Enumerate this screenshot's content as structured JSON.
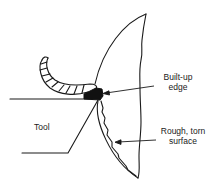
{
  "diagram": {
    "type": "metal-cutting-chip-formation",
    "labels": {
      "built_up_edge_line1": "Built-up",
      "built_up_edge_line2": "edge",
      "rough_surface_line1": "Rough, torn",
      "rough_surface_line2": "surface",
      "tool": "Tool"
    },
    "colors": {
      "stroke": "#1a1a1a",
      "fill_built_up_edge": "#111111",
      "background": "#ffffff"
    }
  }
}
